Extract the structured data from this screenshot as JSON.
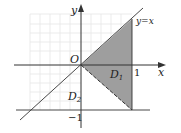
{
  "diagram": {
    "axes": {
      "x_label": "x",
      "y_label": "y",
      "origin_label": "O",
      "tick_x": "1",
      "tick_y": "−1"
    },
    "lines": {
      "diagonal_label": "y=x"
    },
    "regions": {
      "d1_label": "D",
      "d1_sub": "1",
      "d2_label": "D",
      "d2_sub": "2"
    },
    "colors": {
      "shade": "#9e9e9e",
      "grid": "#e6e6e6",
      "line": "#333333"
    }
  }
}
